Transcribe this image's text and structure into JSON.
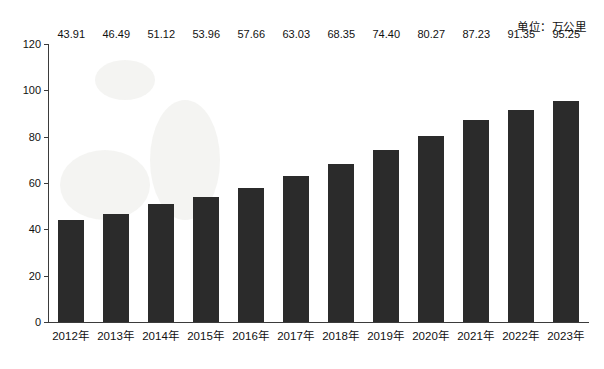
{
  "unit_note": "单位：万公里",
  "chart_data": {
    "type": "bar",
    "title": "",
    "subtitle": "",
    "xlabel": "",
    "ylabel": "",
    "unit": "万公里",
    "categories": [
      "2012年",
      "2013年",
      "2014年",
      "2015年",
      "2016年",
      "2017年",
      "2018年",
      "2019年",
      "2020年",
      "2021年",
      "2022年",
      "2023年"
    ],
    "values": [
      43.91,
      46.49,
      51.12,
      53.96,
      57.66,
      63.03,
      68.35,
      74.4,
      80.27,
      87.23,
      91.35,
      95.25
    ],
    "value_labels": [
      "43.91",
      "46.49",
      "51.12",
      "53.96",
      "57.66",
      "63.03",
      "68.35",
      "74.40",
      "80.27",
      "87.23",
      "91.35",
      "95.25"
    ],
    "ylim": [
      0,
      120
    ],
    "y_ticks": [
      0,
      20,
      40,
      60,
      80,
      100,
      120
    ],
    "y_tick_labels": [
      "0",
      "20",
      "40",
      "60",
      "80",
      "100",
      "120"
    ],
    "grid": false,
    "legend": null,
    "bar_color": "#2b2b2b",
    "axis_color": "#3b3b3b",
    "background": "#ffffff"
  }
}
